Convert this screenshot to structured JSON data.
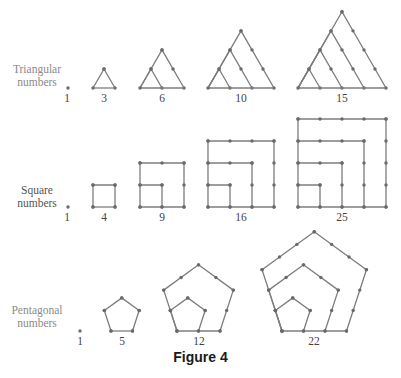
{
  "caption": "Figure 4",
  "colors": {
    "line": "#7d7d7d",
    "dot": "#6a6a6a",
    "row_label": "#8a8a8a",
    "number_label": "#444444",
    "caption": "#1a1a1a"
  },
  "rows": [
    {
      "id": "triangular",
      "label_line1": "Triangular",
      "label_line2": "numbers",
      "figures": [
        {
          "value": "1",
          "kind": "dot",
          "x": 68,
          "base_y": 88
        },
        {
          "value": "3",
          "kind": "triangle",
          "n": 2,
          "x0": 93,
          "base_y": 88,
          "step": 22
        },
        {
          "value": "6",
          "kind": "triangle",
          "n": 3,
          "x0": 140,
          "base_y": 88,
          "step": 22
        },
        {
          "value": "10",
          "kind": "triangle",
          "n": 4,
          "x0": 208,
          "base_y": 88,
          "step": 22
        },
        {
          "value": "15",
          "kind": "triangle",
          "n": 5,
          "x0": 298,
          "base_y": 88,
          "step": 22
        }
      ]
    },
    {
      "id": "square",
      "label_line1": "Square",
      "label_line2": "numbers",
      "figures": [
        {
          "value": "1",
          "kind": "dot",
          "x": 68,
          "base_y": 207
        },
        {
          "value": "4",
          "kind": "square",
          "n": 2,
          "x0": 93,
          "base_y": 207,
          "step": 22
        },
        {
          "value": "9",
          "kind": "square",
          "n": 3,
          "x0": 140,
          "base_y": 207,
          "step": 22
        },
        {
          "value": "16",
          "kind": "square",
          "n": 4,
          "x0": 208,
          "base_y": 207,
          "step": 22
        },
        {
          "value": "25",
          "kind": "square",
          "n": 5,
          "x0": 298,
          "base_y": 207,
          "step": 22
        }
      ]
    },
    {
      "id": "pentagonal",
      "label_line1": "Pentagonal",
      "label_line2": "numbers",
      "figures": [
        {
          "value": "1",
          "kind": "dot",
          "x": 80,
          "base_y": 331
        },
        {
          "value": "5",
          "kind": "pentagon",
          "n": 2,
          "x0": 111,
          "base_y": 331,
          "step": 21.5
        },
        {
          "value": "12",
          "kind": "pentagon",
          "n": 3,
          "x0": 177,
          "base_y": 331,
          "step": 21.5
        },
        {
          "value": "22",
          "kind": "pentagon",
          "n": 4,
          "x0": 282,
          "base_y": 331,
          "step": 21.5
        }
      ]
    }
  ]
}
